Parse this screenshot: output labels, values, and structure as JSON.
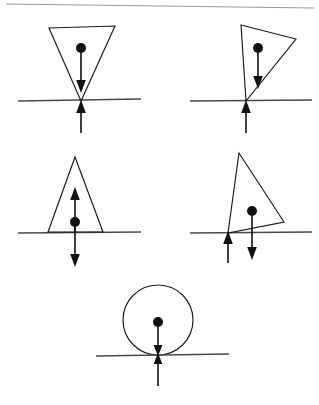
{
  "document": {
    "title": "Free Body Diagrams of Rigid Bodies on a Surface",
    "background_color": "#ffffff",
    "width": 319,
    "height": 405,
    "top_rule": {
      "label": "horizontal rule",
      "color": "#9a9a9a",
      "x1": 6,
      "y1": 4,
      "x2": 314,
      "y2": 8
    }
  },
  "style": {
    "outline_color": "#1a1a1a",
    "ground_color": "#4a4a4a",
    "force_color": "#111111",
    "dot_color": "#111111"
  },
  "figures": [
    {
      "id": "figure-1",
      "name": "inverted-triangle-upright",
      "shape": "triangle",
      "caption": "",
      "ground": {
        "x1": 18,
        "y1": 101,
        "x2": 141,
        "y2": 99
      },
      "polygon": "49,28 115,26 81,101",
      "center_of_mass": {
        "x": 81,
        "y": 48,
        "r": 5.0
      },
      "forces": [
        {
          "name": "weight-force-down",
          "direction": "down",
          "x": 81,
          "y_start": 52,
          "y_end": 92,
          "head": "92"
        },
        {
          "name": "normal-force-up",
          "direction": "up",
          "x": 81,
          "y_start": 133,
          "y_end": 101,
          "head": "101"
        }
      ]
    },
    {
      "id": "figure-2",
      "name": "tilted-triangle-tipping",
      "shape": "triangle",
      "caption": "",
      "ground": {
        "x1": 190,
        "y1": 101,
        "x2": 312,
        "y2": 100
      },
      "polygon": "241,25 296,39 246,101",
      "center_of_mass": {
        "x": 258,
        "y": 48,
        "r": 5.0
      },
      "forces": [
        {
          "name": "weight-force-down",
          "direction": "down",
          "x": 258,
          "y_start": 52,
          "y_end": 88,
          "head": "88"
        },
        {
          "name": "normal-force-up",
          "direction": "up",
          "x": 246,
          "y_start": 133,
          "y_end": 101,
          "head": "101"
        }
      ]
    },
    {
      "id": "figure-3",
      "name": "upright-triangle-double-arrow",
      "shape": "triangle",
      "caption": "",
      "ground": {
        "x1": 18,
        "y1": 233,
        "x2": 141,
        "y2": 232
      },
      "polygon": "75,157 48,232 103,232",
      "center_of_mass": {
        "x": 75,
        "y": 222,
        "r": 5.0
      },
      "forces": [
        {
          "name": "normal-force-up",
          "direction": "up",
          "x": 75,
          "y_start": 232,
          "y_end": 187,
          "head": "187"
        },
        {
          "name": "weight-force-down",
          "direction": "down",
          "x": 75,
          "y_start": 222,
          "y_end": 266,
          "head": "266"
        }
      ]
    },
    {
      "id": "figure-4",
      "name": "tilted-triangle-pivot",
      "shape": "triangle",
      "caption": "",
      "ground": {
        "x1": 190,
        "y1": 233,
        "x2": 312,
        "y2": 232
      },
      "polygon": "239,153 284,222 228,233",
      "center_of_mass": {
        "x": 252,
        "y": 211,
        "r": 5.0
      },
      "forces": [
        {
          "name": "weight-force-down",
          "direction": "down",
          "x": 252,
          "y_start": 215,
          "y_end": 259,
          "head": "259"
        },
        {
          "name": "normal-force-up",
          "direction": "up",
          "x": 228,
          "y_start": 263,
          "y_end": 232,
          "head": "232"
        }
      ]
    },
    {
      "id": "figure-5",
      "name": "circle-on-surface",
      "shape": "circle",
      "caption": "",
      "ground": {
        "x1": 96,
        "y1": 356,
        "x2": 229,
        "y2": 354
      },
      "circle": {
        "cx": 158,
        "cy": 320,
        "r": 35
      },
      "center_of_mass": {
        "x": 158,
        "y": 322,
        "r": 5.0
      },
      "forces": [
        {
          "name": "weight-force-down",
          "direction": "down",
          "x": 158,
          "y_start": 326,
          "y_end": 355,
          "head": "355"
        },
        {
          "name": "normal-force-up",
          "direction": "up",
          "x": 158,
          "y_start": 385,
          "y_end": 353,
          "head": "353"
        }
      ]
    }
  ]
}
